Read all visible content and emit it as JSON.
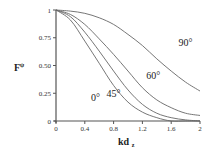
{
  "chart_data": {
    "type": "line",
    "title": "",
    "xlabel": "kd",
    "xlabel_subscript": "z",
    "ylabel": "F",
    "ylabel_subscript": "ψ",
    "xlim": [
      0,
      2
    ],
    "ylim": [
      0,
      1
    ],
    "grid": false,
    "legend": "inline labels",
    "x_ticks": [
      "0",
      "0.4",
      "0.8",
      "1.2",
      "1.6",
      "2"
    ],
    "y_ticks": [
      "0",
      "0.25",
      "0.50",
      "0.75",
      "1"
    ],
    "x": [
      0,
      0.2,
      0.4,
      0.6,
      0.8,
      1.0,
      1.2,
      1.4,
      1.6,
      1.8,
      2.0
    ],
    "series": [
      {
        "name": "0°",
        "values": [
          1,
          0.91,
          0.72,
          0.52,
          0.32,
          0.17,
          0.08,
          0.03,
          0.0,
          0.0,
          0.0
        ]
      },
      {
        "name": "45°",
        "values": [
          1,
          0.94,
          0.8,
          0.63,
          0.45,
          0.28,
          0.15,
          0.07,
          0.03,
          0.01,
          0.0
        ]
      },
      {
        "name": "60°",
        "values": [
          1,
          0.96,
          0.87,
          0.74,
          0.6,
          0.45,
          0.3,
          0.19,
          0.12,
          0.07,
          0.05
        ]
      },
      {
        "name": "90°",
        "values": [
          1,
          0.99,
          0.97,
          0.93,
          0.87,
          0.78,
          0.68,
          0.56,
          0.45,
          0.35,
          0.27
        ]
      }
    ],
    "annotations": [
      {
        "text": "90°",
        "x": 1.8,
        "y": 0.68
      },
      {
        "text": "60°",
        "x": 1.35,
        "y": 0.38
      },
      {
        "text": "45°",
        "x": 0.8,
        "y": 0.22
      },
      {
        "text": "0°",
        "x": 0.55,
        "y": 0.18
      }
    ]
  }
}
